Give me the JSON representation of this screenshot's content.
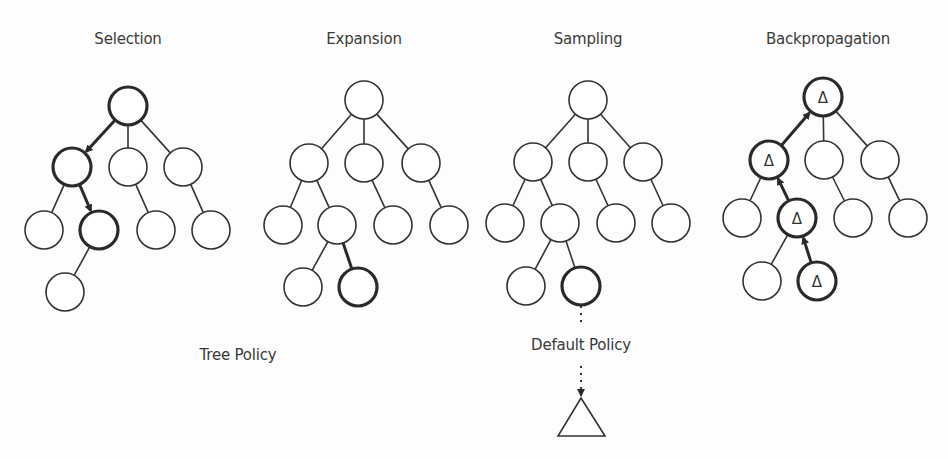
{
  "colors": {
    "background": "#fdfdfd",
    "stroke": "#333333",
    "highlight_stroke": "#2a2a2a",
    "text": "#3a3a3a"
  },
  "phases": [
    {
      "title": "Selection",
      "title_pos": [
        128,
        42
      ],
      "nodes": [
        {
          "id": "r",
          "x": 128,
          "y": 106,
          "bold": true
        },
        {
          "id": "a",
          "x": 72,
          "y": 167,
          "bold": true
        },
        {
          "id": "b",
          "x": 128,
          "y": 167,
          "bold": false
        },
        {
          "id": "c",
          "x": 183,
          "y": 167,
          "bold": false
        },
        {
          "id": "a1",
          "x": 44,
          "y": 230,
          "bold": false
        },
        {
          "id": "a2",
          "x": 99,
          "y": 230,
          "bold": true
        },
        {
          "id": "b1",
          "x": 156,
          "y": 230,
          "bold": false
        },
        {
          "id": "c1",
          "x": 211,
          "y": 230,
          "bold": false
        },
        {
          "id": "a21",
          "x": 65,
          "y": 292,
          "bold": false
        }
      ],
      "edges": [
        {
          "from": "r",
          "to": "a",
          "arrow": "down"
        },
        {
          "from": "r",
          "to": "b"
        },
        {
          "from": "r",
          "to": "c"
        },
        {
          "from": "a",
          "to": "a1"
        },
        {
          "from": "a",
          "to": "a2",
          "arrow": "down"
        },
        {
          "from": "b",
          "to": "b1"
        },
        {
          "from": "c",
          "to": "c1"
        },
        {
          "from": "a2",
          "to": "a21"
        }
      ]
    },
    {
      "title": "Expansion",
      "title_pos": [
        364,
        42
      ],
      "nodes": [
        {
          "id": "r",
          "x": 364,
          "y": 100,
          "bold": false
        },
        {
          "id": "a",
          "x": 309,
          "y": 163,
          "bold": false
        },
        {
          "id": "b",
          "x": 364,
          "y": 163,
          "bold": false
        },
        {
          "id": "c",
          "x": 421,
          "y": 163,
          "bold": false
        },
        {
          "id": "a1",
          "x": 283,
          "y": 225,
          "bold": false
        },
        {
          "id": "a2",
          "x": 337,
          "y": 225,
          "bold": false
        },
        {
          "id": "b1",
          "x": 393,
          "y": 225,
          "bold": false
        },
        {
          "id": "c1",
          "x": 449,
          "y": 225,
          "bold": false
        },
        {
          "id": "a21",
          "x": 303,
          "y": 287,
          "bold": false
        },
        {
          "id": "a22",
          "x": 358,
          "y": 287,
          "bold": true
        }
      ],
      "edges": [
        {
          "from": "r",
          "to": "a"
        },
        {
          "from": "r",
          "to": "b"
        },
        {
          "from": "r",
          "to": "c"
        },
        {
          "from": "a",
          "to": "a1"
        },
        {
          "from": "a",
          "to": "a2"
        },
        {
          "from": "b",
          "to": "b1"
        },
        {
          "from": "c",
          "to": "c1"
        },
        {
          "from": "a2",
          "to": "a21"
        },
        {
          "from": "a2",
          "to": "a22",
          "bold": true
        }
      ]
    },
    {
      "title": "Sampling",
      "title_pos": [
        588,
        42
      ],
      "nodes": [
        {
          "id": "r",
          "x": 588,
          "y": 100,
          "bold": false
        },
        {
          "id": "a",
          "x": 533,
          "y": 162,
          "bold": false
        },
        {
          "id": "b",
          "x": 588,
          "y": 162,
          "bold": false
        },
        {
          "id": "c",
          "x": 643,
          "y": 162,
          "bold": false
        },
        {
          "id": "a1",
          "x": 505,
          "y": 223,
          "bold": false
        },
        {
          "id": "a2",
          "x": 560,
          "y": 223,
          "bold": false
        },
        {
          "id": "b1",
          "x": 616,
          "y": 223,
          "bold": false
        },
        {
          "id": "c1",
          "x": 671,
          "y": 223,
          "bold": false
        },
        {
          "id": "a21",
          "x": 526,
          "y": 286,
          "bold": false
        },
        {
          "id": "a22",
          "x": 581,
          "y": 286,
          "bold": true
        }
      ],
      "edges": [
        {
          "from": "r",
          "to": "a"
        },
        {
          "from": "r",
          "to": "b"
        },
        {
          "from": "r",
          "to": "c"
        },
        {
          "from": "a",
          "to": "a1"
        },
        {
          "from": "a",
          "to": "a2"
        },
        {
          "from": "b",
          "to": "b1"
        },
        {
          "from": "c",
          "to": "c1"
        },
        {
          "from": "a2",
          "to": "a21"
        },
        {
          "from": "a2",
          "to": "a22"
        }
      ]
    },
    {
      "title": "Backpropagation",
      "title_pos": [
        828,
        42
      ],
      "nodes": [
        {
          "id": "r",
          "x": 823,
          "y": 97,
          "bold": true,
          "delta": true
        },
        {
          "id": "a",
          "x": 769,
          "y": 160,
          "bold": true,
          "delta": true
        },
        {
          "id": "b",
          "x": 824,
          "y": 160,
          "bold": false
        },
        {
          "id": "c",
          "x": 880,
          "y": 160,
          "bold": false
        },
        {
          "id": "a1",
          "x": 742,
          "y": 218,
          "bold": false
        },
        {
          "id": "a2",
          "x": 797,
          "y": 218,
          "bold": true,
          "delta": true
        },
        {
          "id": "b1",
          "x": 853,
          "y": 218,
          "bold": false
        },
        {
          "id": "c1",
          "x": 908,
          "y": 218,
          "bold": false
        },
        {
          "id": "a21",
          "x": 762,
          "y": 281,
          "bold": false
        },
        {
          "id": "a22",
          "x": 817,
          "y": 281,
          "bold": true,
          "delta": true
        }
      ],
      "edges": [
        {
          "from": "a",
          "to": "r",
          "arrow": "up"
        },
        {
          "from": "r",
          "to": "b"
        },
        {
          "from": "r",
          "to": "c"
        },
        {
          "from": "a",
          "to": "a1"
        },
        {
          "from": "a2",
          "to": "a",
          "arrow": "up"
        },
        {
          "from": "b",
          "to": "b1"
        },
        {
          "from": "c",
          "to": "c1"
        },
        {
          "from": "a2",
          "to": "a21"
        },
        {
          "from": "a22",
          "to": "a2",
          "arrow": "up"
        }
      ]
    }
  ],
  "delta_symbol": "Δ",
  "policies": {
    "tree_policy": {
      "label": "Tree Policy",
      "pos": [
        238,
        346
      ]
    },
    "default_policy": {
      "label": "Default Policy",
      "pos": [
        581,
        336
      ]
    }
  },
  "default_policy_path": {
    "from": [
      581,
      306
    ],
    "text_gap": [
      326,
      360
    ],
    "to_triangle_apex": [
      581,
      398
    ],
    "triangle": {
      "apex": [
        581,
        398
      ],
      "base_left": [
        558,
        436
      ],
      "base_right": [
        605,
        436
      ]
    }
  },
  "node_radius": 19
}
